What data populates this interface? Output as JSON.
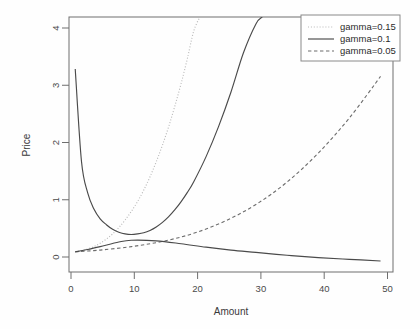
{
  "chart_data": {
    "type": "line",
    "title": "",
    "xlabel": "Amount",
    "ylabel": "Price",
    "xlim": [
      0,
      52
    ],
    "ylim": [
      -0.12,
      4.3
    ],
    "xticks": [
      0,
      10,
      20,
      30,
      40,
      50
    ],
    "yticks": [
      0,
      1,
      2,
      3,
      4
    ],
    "xticklabels": [
      "0",
      "10",
      "20",
      "30",
      "40",
      "50"
    ],
    "yticklabels": [
      "0",
      "1",
      "2",
      "3",
      "4"
    ],
    "grid": false,
    "legend_position": "top-right",
    "legend": [
      {
        "label": "gamma=0.15",
        "style": "dotted",
        "color": "#b9b9b9"
      },
      {
        "label": "gamma=0.1",
        "style": "solid",
        "color": "#4a4a4a"
      },
      {
        "label": "gamma=0.05",
        "style": "dashed",
        "color": "#6d6d6d"
      }
    ],
    "series": [
      {
        "name": "gamma=0.15 total cost",
        "style": "dotted",
        "x": [
          1,
          2,
          3,
          4,
          5,
          6,
          7,
          8,
          9,
          10,
          11,
          12,
          13,
          14,
          15,
          16,
          17,
          18,
          19,
          20,
          21
        ],
        "y": [
          0.23,
          0.25,
          0.28,
          0.32,
          0.38,
          0.45,
          0.54,
          0.65,
          0.78,
          0.93,
          1.1,
          1.3,
          1.53,
          1.79,
          2.08,
          2.4,
          2.76,
          3.15,
          3.58,
          4.05,
          4.3
        ]
      },
      {
        "name": "gamma=0.1 holding cost",
        "style": "solid",
        "x": [
          1,
          2,
          3,
          4,
          5,
          6,
          7,
          8,
          9,
          10,
          11,
          12,
          13,
          14,
          15,
          16,
          17,
          18,
          19,
          20,
          22,
          24,
          26,
          28,
          30,
          31
        ],
        "y": [
          3.4,
          1.8,
          1.25,
          0.97,
          0.8,
          0.7,
          0.62,
          0.57,
          0.54,
          0.53,
          0.54,
          0.56,
          0.6,
          0.66,
          0.74,
          0.84,
          0.96,
          1.1,
          1.26,
          1.44,
          1.88,
          2.4,
          3.0,
          3.68,
          4.18,
          4.3
        ]
      },
      {
        "name": "gamma=0.05 total cost",
        "style": "dashed",
        "x": [
          1,
          5,
          10,
          15,
          20,
          25,
          30,
          35,
          40,
          45,
          50
        ],
        "y": [
          0.23,
          0.26,
          0.32,
          0.41,
          0.55,
          0.76,
          1.05,
          1.44,
          1.94,
          2.55,
          3.27
        ]
      },
      {
        "name": "gamma=0.1 decay branch",
        "style": "solid",
        "x": [
          1,
          3,
          5,
          8,
          10,
          14,
          18,
          22,
          26,
          30,
          35,
          40,
          45,
          50
        ],
        "y": [
          0.23,
          0.27,
          0.32,
          0.4,
          0.43,
          0.42,
          0.37,
          0.31,
          0.26,
          0.22,
          0.17,
          0.13,
          0.1,
          0.07
        ]
      }
    ]
  },
  "axes": {
    "ylabel": "Price",
    "xlabel": "Amount"
  }
}
